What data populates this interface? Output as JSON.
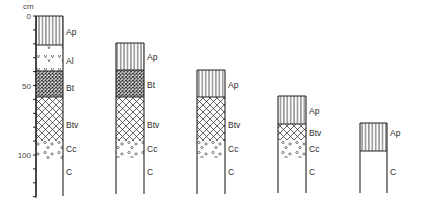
{
  "axis": {
    "unit_label": "cm",
    "tick_labels": [
      {
        "value": 0,
        "label": "0"
      },
      {
        "value": 50,
        "label": "50"
      },
      {
        "value": 100,
        "label": "100"
      }
    ],
    "minor_tick_step_cm": 10,
    "max_cm": 130
  },
  "scale": {
    "origin_y": 16,
    "px_per_cm": 1.39
  },
  "colors": {
    "line": "#222222",
    "background": "#ffffff"
  },
  "profiles": [
    {
      "name": "profile-1",
      "x": 36,
      "width": 27,
      "bottom_y": 196,
      "layers": [
        {
          "label": "Ap",
          "pattern": "vertical-lines",
          "top": 16,
          "bottom": 45,
          "label_y": 35
        },
        {
          "label": "Al",
          "pattern": "v-marks",
          "top": 45,
          "bottom": 71,
          "label_y": 64
        },
        {
          "label": "Bt",
          "pattern": "dense-crosshatch",
          "top": 71,
          "bottom": 97,
          "label_y": 91
        },
        {
          "label": "Btv",
          "pattern": "coarse-crosshatch",
          "top": 97,
          "bottom": 141,
          "label_y": 128
        },
        {
          "label": "Cc",
          "pattern": "pebbles",
          "top": 141,
          "bottom": 160,
          "label_y": 152
        },
        {
          "label": "C",
          "pattern": "none",
          "top": 160,
          "bottom": 196,
          "label_y": 175
        }
      ]
    },
    {
      "name": "profile-2",
      "x": 116,
      "width": 28,
      "bottom_y": 194,
      "layers": [
        {
          "label": "Ap",
          "pattern": "vertical-lines",
          "top": 43,
          "bottom": 70,
          "label_y": 60
        },
        {
          "label": "Bt",
          "pattern": "dense-crosshatch",
          "top": 70,
          "bottom": 97,
          "label_y": 88
        },
        {
          "label": "Btv",
          "pattern": "coarse-crosshatch",
          "top": 97,
          "bottom": 141,
          "label_y": 128
        },
        {
          "label": "Cc",
          "pattern": "pebbles",
          "top": 141,
          "bottom": 158,
          "label_y": 152
        },
        {
          "label": "C",
          "pattern": "none",
          "top": 158,
          "bottom": 194,
          "label_y": 175
        }
      ]
    },
    {
      "name": "profile-3",
      "x": 197,
      "width": 28,
      "bottom_y": 194,
      "layers": [
        {
          "label": "Ap",
          "pattern": "vertical-lines",
          "top": 70,
          "bottom": 97,
          "label_y": 88
        },
        {
          "label": "Btv",
          "pattern": "coarse-crosshatch",
          "top": 97,
          "bottom": 141,
          "label_y": 128
        },
        {
          "label": "Cc",
          "pattern": "pebbles",
          "top": 141,
          "bottom": 158,
          "label_y": 152
        },
        {
          "label": "C",
          "pattern": "none",
          "top": 158,
          "bottom": 194,
          "label_y": 175
        }
      ]
    },
    {
      "name": "profile-4",
      "x": 278,
      "width": 28,
      "bottom_y": 193,
      "layers": [
        {
          "label": "Ap",
          "pattern": "vertical-lines",
          "top": 96,
          "bottom": 124,
          "label_y": 114
        },
        {
          "label": "Btv",
          "pattern": "coarse-crosshatch",
          "top": 124,
          "bottom": 140,
          "label_y": 136
        },
        {
          "label": "Cc",
          "pattern": "pebbles",
          "top": 140,
          "bottom": 158,
          "label_y": 152
        },
        {
          "label": "C",
          "pattern": "none",
          "top": 158,
          "bottom": 193,
          "label_y": 175
        }
      ]
    },
    {
      "name": "profile-5",
      "x": 360,
      "width": 27,
      "bottom_y": 193,
      "layers": [
        {
          "label": "Ap",
          "pattern": "vertical-lines",
          "top": 123,
          "bottom": 151,
          "label_y": 136
        },
        {
          "label": "C",
          "pattern": "none",
          "top": 151,
          "bottom": 193,
          "label_y": 175
        }
      ]
    }
  ]
}
